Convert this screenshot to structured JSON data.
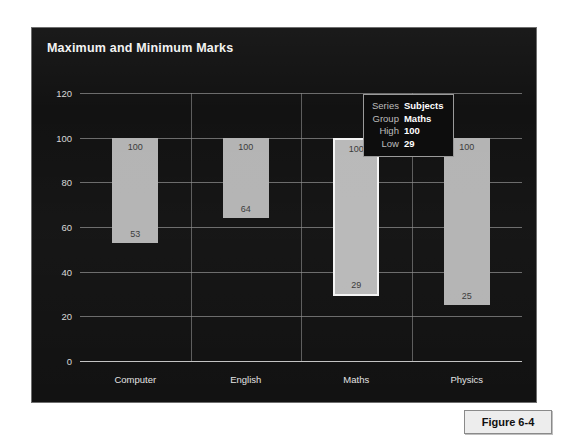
{
  "figure": {
    "caption": "Figure 6-4"
  },
  "chart_data": {
    "type": "bar",
    "title": "Maximum and Minimum Marks",
    "subtitle": "",
    "xlabel": "",
    "ylabel": "",
    "categories": [
      "Computer",
      "English",
      "Maths",
      "Physics"
    ],
    "series": [
      {
        "name": "High",
        "values": [
          100,
          100,
          100,
          100
        ]
      },
      {
        "name": "Low",
        "values": [
          53,
          64,
          29,
          25
        ]
      }
    ],
    "bars": [
      {
        "category": "Computer",
        "high": 100,
        "low": 53,
        "high_label": "100",
        "low_label": "53",
        "selected": false
      },
      {
        "category": "English",
        "high": 100,
        "low": 64,
        "high_label": "100",
        "low_label": "64",
        "selected": false
      },
      {
        "category": "Maths",
        "high": 100,
        "low": 29,
        "high_label": "100",
        "low_label": "29",
        "selected": true
      },
      {
        "category": "Physics",
        "high": 100,
        "low": 25,
        "high_label": "100",
        "low_label": "25",
        "selected": false
      }
    ],
    "ylim": [
      0,
      120
    ],
    "yticks": [
      120,
      100,
      80,
      60,
      40,
      20,
      0
    ],
    "ytick_labels": [
      "120",
      "100",
      "80",
      "60",
      "40",
      "20",
      "0"
    ],
    "grid": true,
    "legend": "none",
    "colors": {
      "panel_background": "#121212",
      "bar_fill": "#b4b4b4",
      "selection_outline": "#f4f4f4",
      "gridline": "#8d8d8d",
      "axis_line": "#cfcfcf",
      "title_text": "#f2f2f2",
      "tick_text": "#d8d8d8"
    }
  },
  "tooltip": {
    "visible": true,
    "rows": [
      {
        "label": "Series",
        "value": "Subjects"
      },
      {
        "label": "Group",
        "value": "Maths"
      },
      {
        "label": "High",
        "value": "100"
      },
      {
        "label": "Low",
        "value": "29"
      }
    ]
  }
}
